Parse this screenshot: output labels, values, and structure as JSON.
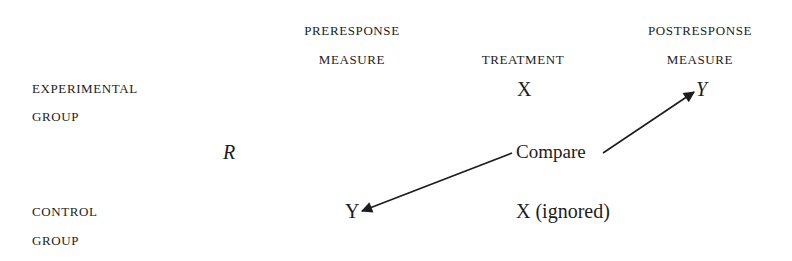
{
  "columns": {
    "preresponse": {
      "line1": "PRERESPONSE",
      "line2": "MEASURE"
    },
    "treatment": {
      "line1": "TREATMENT"
    },
    "postresponse": {
      "line1": "POSTRESPONSE",
      "line2": "MEASURE"
    }
  },
  "rows": {
    "experimental": {
      "line1": "EXPERIMENTAL",
      "line2": "GROUP"
    },
    "control": {
      "line1": "CONTROL",
      "line2": "GROUP"
    }
  },
  "randomization": {
    "symbol": "R"
  },
  "experimental_cells": {
    "treatment": "X",
    "post_measure": "Y"
  },
  "control_cells": {
    "pre_measure": "Y",
    "treatment": "X (ignored)"
  },
  "comparison": {
    "label": "Compare",
    "from": "control pre-measure Y",
    "to": "experimental post-measure Y"
  }
}
